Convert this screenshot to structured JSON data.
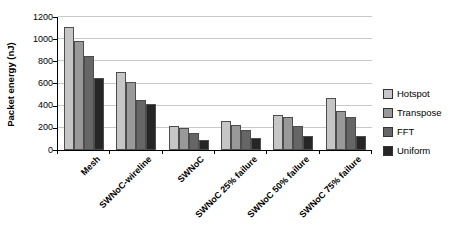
{
  "chart_data": {
    "type": "bar",
    "title": "",
    "xlabel": "",
    "ylabel": "Packet energy (nJ)",
    "ylim": [
      0,
      1200
    ],
    "ytick_step": 200,
    "yticks": [
      0,
      200,
      400,
      600,
      800,
      1000,
      1200
    ],
    "grid": true,
    "gridline_color": "#c9c9c9",
    "bar_border_color": "#4d4d4d",
    "legend_position": "right",
    "categories": [
      "Mesh",
      "SWNoC-wireline",
      "SWNoC",
      "SWNoC 25% failure",
      "SWNoC 50% failure",
      "SWNoC 75% failure"
    ],
    "series": [
      {
        "name": "Hotspot",
        "color": "#c6c6c6",
        "values": [
          1110,
          700,
          220,
          265,
          320,
          470
        ]
      },
      {
        "name": "Transpose",
        "color": "#999999",
        "values": [
          980,
          610,
          195,
          230,
          300,
          350
        ]
      },
      {
        "name": "FFT",
        "color": "#666666",
        "values": [
          850,
          450,
          155,
          180,
          220,
          295
        ]
      },
      {
        "name": "Uniform",
        "color": "#262626",
        "values": [
          650,
          415,
          90,
          105,
          130,
          130
        ]
      }
    ]
  }
}
